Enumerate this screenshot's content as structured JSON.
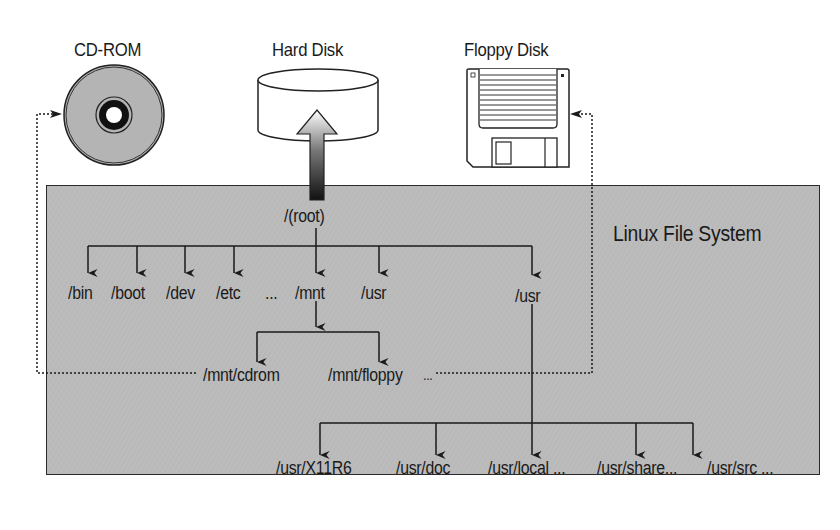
{
  "diagram": {
    "title": "Linux File System",
    "colors": {
      "filesystem_fill": "#b9b9b9",
      "line": "#1a1a1a",
      "cd_disc": "#b4b4b4",
      "background": "#ffffff"
    },
    "devices": [
      {
        "id": "cdrom",
        "label": "CD-ROM",
        "icon": "cd-rom-disc-icon"
      },
      {
        "id": "harddisk",
        "label": "Hard Disk",
        "icon": "hard-disk-cylinder-icon"
      },
      {
        "id": "floppy",
        "label": "Floppy Disk",
        "icon": "floppy-disk-icon"
      }
    ],
    "root": {
      "label": "/(root)"
    },
    "top_level_dirs": [
      {
        "label": "/bin"
      },
      {
        "label": "/boot"
      },
      {
        "label": "/dev"
      },
      {
        "label": "/etc"
      },
      {
        "label": "..."
      },
      {
        "label": "/mnt"
      },
      {
        "label": "/usr"
      },
      {
        "label": "/usr"
      }
    ],
    "mnt_children": [
      {
        "label": "/mnt/cdrom"
      },
      {
        "label": "/mnt/floppy"
      },
      {
        "label": "..."
      }
    ],
    "usr_children": [
      {
        "label": "/usr/X11R6"
      },
      {
        "label": "/usr/doc"
      },
      {
        "label": "/usr/local ..."
      },
      {
        "label": "/usr/share..."
      },
      {
        "label": "/usr/src ..."
      }
    ],
    "mount_links": [
      {
        "from": "/mnt/cdrom",
        "to": "CD-ROM",
        "style": "dotted"
      },
      {
        "from": "/mnt/floppy",
        "to": "Floppy Disk",
        "style": "dotted"
      }
    ]
  }
}
